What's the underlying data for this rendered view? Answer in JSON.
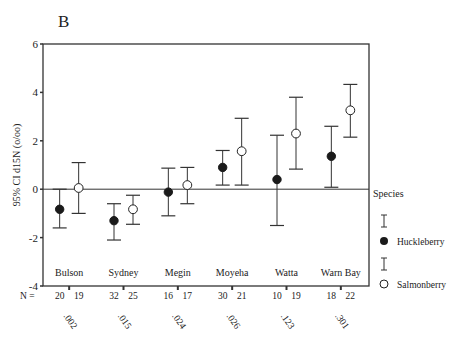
{
  "panel_label": "B",
  "chart_data": {
    "type": "errorbar",
    "title": "",
    "panel": "B",
    "ylabel": "95% CI d15N (o/oo)",
    "xlabel": "",
    "ylim": [
      -4,
      6
    ],
    "yticks": [
      6,
      4,
      2,
      0,
      -2,
      -4
    ],
    "grid": false,
    "reference_line": 0,
    "categories": [
      "Bulson",
      "Sydney",
      "Megin",
      "Moyeha",
      "Watta",
      "Warn Bay"
    ],
    "n_label": "N =",
    "p_values": [
      ".002",
      ".015",
      ".024",
      ".026",
      ".123",
      ".301"
    ],
    "legend": {
      "title": "Species",
      "position": "right"
    },
    "series": [
      {
        "name": "Huckleberry",
        "marker": "filled-circle",
        "n": [
          20,
          32,
          16,
          30,
          10,
          18
        ],
        "mean": [
          -0.83,
          -1.3,
          -0.12,
          0.9,
          0.4,
          1.36
        ],
        "ci_low": [
          -1.6,
          -2.1,
          -1.1,
          0.17,
          -1.5,
          0.08
        ],
        "ci_high": [
          0.0,
          -0.6,
          0.87,
          1.6,
          2.23,
          2.6
        ]
      },
      {
        "name": "Salmonberry",
        "marker": "open-circle",
        "n": [
          19,
          25,
          17,
          21,
          19,
          22
        ],
        "mean": [
          0.05,
          -0.83,
          0.17,
          1.57,
          2.3,
          3.26
        ],
        "ci_low": [
          -1.0,
          -1.45,
          -0.6,
          0.17,
          0.83,
          2.15
        ],
        "ci_high": [
          1.1,
          -0.25,
          0.9,
          2.93,
          3.8,
          4.33
        ]
      }
    ]
  }
}
